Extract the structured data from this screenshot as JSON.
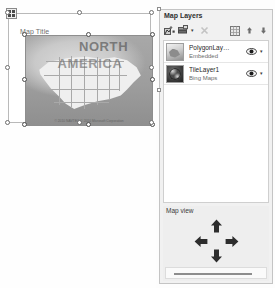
{
  "design_surface": {
    "map_title": "Map Title",
    "move_handle_icon": "move-handle-icon",
    "map": {
      "labels": {
        "continent_line1": "NORTH",
        "continent_line2": "AMERICA"
      },
      "attribution": "© 2010 NAVTEQ © 2010 Microsoft Corporation"
    }
  },
  "layers_panel": {
    "header": "Map Layers",
    "toolbar": {
      "buttons": [
        {
          "name": "add-layer-wizard-icon",
          "label": ""
        },
        {
          "name": "add-layer-icon",
          "label": ""
        },
        {
          "name": "add-layer-dropdown-caret",
          "label": "▾"
        },
        {
          "name": "delete-layer-icon",
          "label": ""
        },
        {
          "name": "layer-properties-icon",
          "label": ""
        },
        {
          "name": "move-layer-up-icon",
          "label": ""
        },
        {
          "name": "move-layer-down-icon",
          "label": ""
        }
      ]
    },
    "layers": [
      {
        "name": "PolygonLay…",
        "source": "Embedded",
        "thumbnail_icon": "polygon-layer-thumbnail-icon",
        "visibility_icon": "eye-icon",
        "menu_caret": "▾"
      },
      {
        "name": "TileLayer1",
        "source": "Bing Maps",
        "thumbnail_icon": "globe-layer-thumbnail-icon",
        "visibility_icon": "eye-icon",
        "menu_caret": "▾"
      }
    ],
    "map_view": {
      "label": "Map view",
      "pan_up_icon": "arrow-up-icon",
      "pan_down_icon": "arrow-down-icon",
      "pan_left_icon": "arrow-left-icon",
      "pan_right_icon": "arrow-right-icon",
      "zoom_slider_name": "zoom-slider"
    }
  },
  "colors": {
    "panel_background": "#f1f1f1",
    "list_background": "#ffffff",
    "text_primary": "#1f1f1f",
    "text_secondary": "#6b6b6b",
    "border": "#c4c4c4",
    "handle_border": "#6d6d6d"
  }
}
